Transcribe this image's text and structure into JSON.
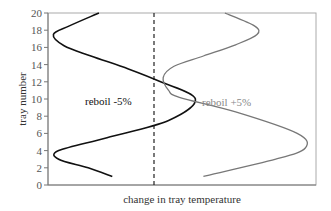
{
  "chart_data": {
    "type": "line",
    "title": "",
    "xlabel": "change in tray temperature",
    "ylabel": "tray number",
    "ylim": [
      0,
      20
    ],
    "yticks": [
      0,
      2,
      4,
      6,
      8,
      10,
      12,
      14,
      16,
      18,
      20
    ],
    "xticks": [],
    "grid": false,
    "legend": null,
    "reference_line": {
      "style": "dashed",
      "orientation": "vertical",
      "position": "x = 0 (no change)"
    },
    "series": [
      {
        "name": "reboil -5%",
        "color": "#111111",
        "points_relative_x": [
          {
            "x": 0.19,
            "y": 20
          },
          {
            "x": 0.08,
            "y": 18.5
          },
          {
            "x": 0.02,
            "y": 17.5
          },
          {
            "x": 0.06,
            "y": 16.2
          },
          {
            "x": 0.16,
            "y": 15
          },
          {
            "x": 0.3,
            "y": 13.5
          },
          {
            "x": 0.42,
            "y": 12
          },
          {
            "x": 0.55,
            "y": 10
          },
          {
            "x": 0.45,
            "y": 7.5
          },
          {
            "x": 0.22,
            "y": 5.5
          },
          {
            "x": 0.04,
            "y": 4
          },
          {
            "x": 0.04,
            "y": 3
          },
          {
            "x": 0.15,
            "y": 2
          },
          {
            "x": 0.24,
            "y": 1
          }
        ]
      },
      {
        "name": "reboil +5%",
        "color": "#777777",
        "points_relative_x": [
          {
            "x": 0.66,
            "y": 20
          },
          {
            "x": 0.77,
            "y": 18.5
          },
          {
            "x": 0.78,
            "y": 17.5
          },
          {
            "x": 0.7,
            "y": 16.3
          },
          {
            "x": 0.58,
            "y": 15
          },
          {
            "x": 0.47,
            "y": 13.8
          },
          {
            "x": 0.43,
            "y": 12.5
          },
          {
            "x": 0.45,
            "y": 11
          },
          {
            "x": 0.49,
            "y": 10.2
          },
          {
            "x": 0.7,
            "y": 8.5
          },
          {
            "x": 0.93,
            "y": 6
          },
          {
            "x": 0.96,
            "y": 4.3
          },
          {
            "x": 0.85,
            "y": 3
          },
          {
            "x": 0.58,
            "y": 1
          }
        ]
      }
    ],
    "annotations": [
      {
        "text": "reboil -5%",
        "near_series": "reboil -5%"
      },
      {
        "text": "reboil +5%",
        "near_series": "reboil +5%"
      }
    ]
  },
  "labels": {
    "ylabel": "tray number",
    "xlabel": "change in tray temperature",
    "annot_left": "reboil -5%",
    "annot_right": "reboil +5%",
    "yticks": [
      "0",
      "2",
      "4",
      "6",
      "8",
      "10",
      "12",
      "14",
      "16",
      "18",
      "20"
    ]
  }
}
